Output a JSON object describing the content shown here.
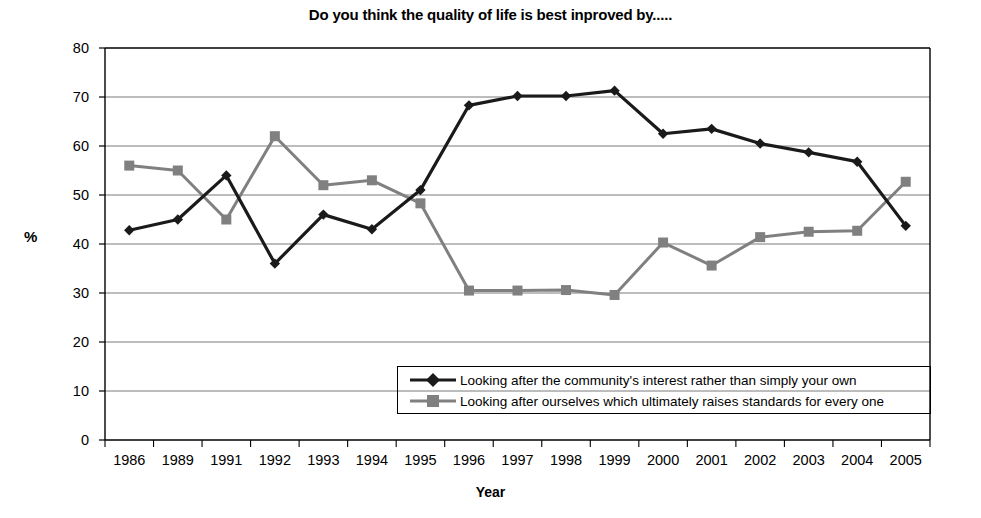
{
  "chart_data": {
    "type": "line",
    "title": "Do you think the quality of life is best inproved by.....",
    "xlabel": "Year",
    "ylabel": "%",
    "ylim": [
      0,
      80
    ],
    "ytick_step": 10,
    "grid": true,
    "legend_position": "inside-bottom-right",
    "categories": [
      "1986",
      "1989",
      "1991",
      "1992",
      "1993",
      "1994",
      "1995",
      "1996",
      "1997",
      "1998",
      "1999",
      "2000",
      "2001",
      "2002",
      "2003",
      "2004",
      "2005"
    ],
    "ytick_labels": [
      "80",
      "70",
      "60",
      "50",
      "40",
      "30",
      "20",
      "10",
      "0"
    ],
    "series": [
      {
        "name": "Looking after the community's interest rather than simply your own",
        "color": "#1a1a1a",
        "marker": "diamond",
        "values": [
          42.8,
          45.0,
          54.0,
          36.0,
          46.0,
          43.0,
          51.0,
          68.3,
          70.2,
          70.2,
          71.3,
          62.5,
          63.5,
          60.5,
          58.7,
          56.8,
          43.7
        ]
      },
      {
        "name": "Looking after ourselves which ultimately raises standards for every one",
        "color": "#808080",
        "marker": "square",
        "values": [
          56.0,
          55.0,
          45.0,
          62.0,
          52.0,
          53.0,
          48.3,
          30.5,
          30.5,
          30.6,
          29.6,
          40.3,
          35.6,
          41.4,
          42.5,
          42.7,
          52.7
        ]
      }
    ]
  }
}
